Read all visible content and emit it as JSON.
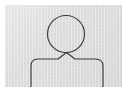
{
  "image": {
    "kind": "user-avatar-placeholder",
    "alt_text": "Generic person silhouette outline",
    "width_px": "124",
    "height_px": "87"
  },
  "colors": {
    "background": "#ffffff",
    "plate": "#dcdcda",
    "stroke": "#3a3a3a"
  },
  "icon": {
    "name": "person-placeholder-icon",
    "label": "",
    "parts": [
      {
        "name": "head",
        "shape": "circle",
        "cx": "66",
        "cy": "34",
        "r": "18"
      },
      {
        "name": "shoulders",
        "shape": "path",
        "left_edge_x": "30",
        "right_edge_x": "104",
        "top_y": "58"
      }
    ]
  }
}
